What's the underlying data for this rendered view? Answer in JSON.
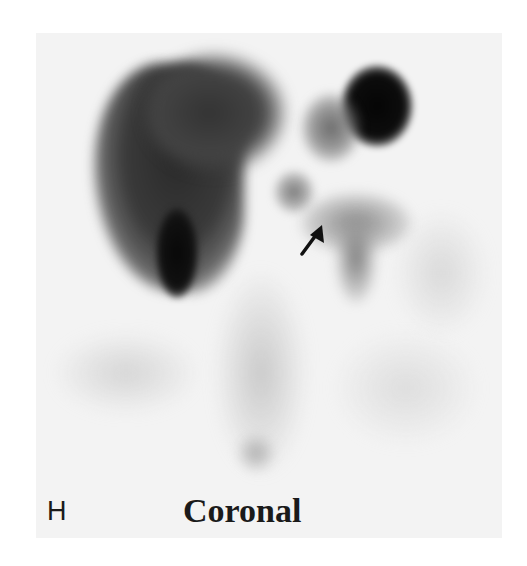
{
  "figure": {
    "panel_label": "H",
    "caption": "Coronal",
    "annotations": [
      {
        "type": "arrow",
        "direction": "up-right",
        "target": "small focal activity near midline"
      }
    ],
    "colors": {
      "background": "#ffffff",
      "image_base": "#f3f3f3",
      "dense_activity": "#0a0a0a",
      "moderate_activity": "#555555",
      "faint_activity": "#cfcfcf"
    }
  }
}
